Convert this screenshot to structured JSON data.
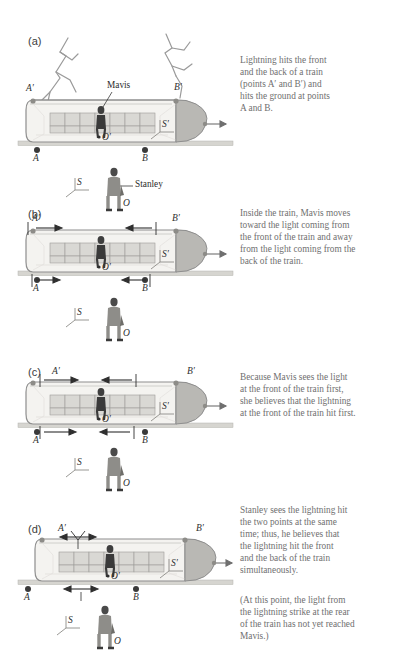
{
  "figure": {
    "text_color": "#6f6f6f",
    "label_color": "#2f2f2f",
    "train_body_color": "#f2f1ee",
    "train_outline_color": "#8e8e8e",
    "seat_color": "#d7d6d2",
    "nose_color": "#b9b8b4",
    "rail_color": "#cfcec9",
    "person_color": "#8a8a8a",
    "lightning_color": "#9a9a9a"
  },
  "panels": [
    {
      "id": "a",
      "label": "(a)",
      "caption": "Lightning hits the front and the back of a train (points A′ and B′) and hits the ground at points A and B.",
      "caption_lines": [
        "Lightning hits the front",
        "and the back of a train",
        "(points A′ and B′) and",
        "hits the ground at points",
        "A and B."
      ],
      "marks": {
        "train_rear": "A′",
        "train_front": "B′",
        "ground_rear": "A",
        "ground_front": "B",
        "train_origin": "O′",
        "ground_origin": "O",
        "train_frame": "S′",
        "ground_frame": "S"
      },
      "callouts": [
        {
          "name": "mavis-callout",
          "text": "Mavis"
        },
        {
          "name": "stanley-callout",
          "text": "Stanley"
        }
      ],
      "lightning": true,
      "light_stage": "strike"
    },
    {
      "id": "b",
      "label": "(b)",
      "caption": "Inside the train, Mavis moves toward the light coming from the front of the train and away from the light coming from the back of the train.",
      "caption_lines": [
        "Inside the train, Mavis moves",
        "toward the light coming from",
        "the front of the train and away",
        "from the light coming from the",
        "back of the train."
      ],
      "marks": {
        "train_rear": "A′",
        "train_front": "B′",
        "ground_rear": "A",
        "ground_front": "B",
        "train_origin": "O′",
        "ground_origin": "O",
        "train_frame": "S′",
        "ground_frame": "S"
      },
      "callouts": [],
      "lightning": false,
      "light_stage": "early"
    },
    {
      "id": "c",
      "label": "(c)",
      "caption": "Because Mavis sees the light at the front of the train first, she believes that the lightning at the front of the train hit first.",
      "caption_lines": [
        "Because Mavis sees the light",
        "at the front of the train first,",
        "she believes that the lightning",
        "at the front of the train hit first."
      ],
      "marks": {
        "train_rear": "A′",
        "train_front": "B′",
        "ground_rear": "A",
        "ground_front": "B",
        "train_origin": "O′",
        "ground_origin": "O",
        "train_frame": "S′",
        "ground_frame": "S"
      },
      "callouts": [],
      "lightning": false,
      "light_stage": "front-reaches-mavis"
    },
    {
      "id": "d",
      "label": "(d)",
      "caption": "Stanley sees the lightning hit the two points at the same time; thus, he believes that the lightning hit the front and the back of the train simultaneously.",
      "caption_lines": [
        "Stanley sees the lightning hit",
        "the two points at the same",
        "time; thus, he believes that",
        "the lightning hit the front",
        "and the back of the train",
        "simultaneously."
      ],
      "caption2": "(At this point, the light from the lightning strike at the rear of the train has not yet reached Mavis.)",
      "caption2_lines": [
        "(At this point, the light from",
        "the lightning strike at the rear",
        "of the train has not yet reached",
        "Mavis.)"
      ],
      "marks": {
        "train_rear": "A′",
        "train_front": "B′",
        "ground_rear": "A",
        "ground_front": "B",
        "train_origin": "O′",
        "ground_origin": "O",
        "train_frame": "S′",
        "ground_frame": "S"
      },
      "callouts": [],
      "lightning": false,
      "light_stage": "converged-at-stanley"
    }
  ]
}
